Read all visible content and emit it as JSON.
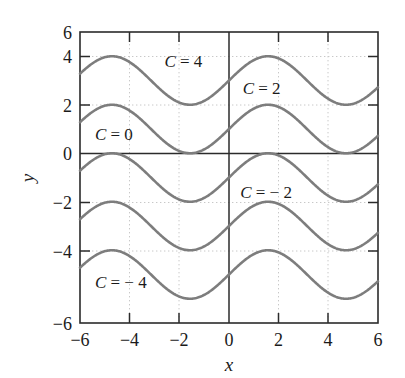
{
  "chart_data": {
    "type": "line",
    "title": "",
    "xlabel": "x",
    "ylabel": "y",
    "xlim": [
      -6,
      6
    ],
    "ylim": [
      -6,
      6
    ],
    "xticks": [
      -6,
      -4,
      -2,
      0,
      2,
      4,
      6
    ],
    "yticks": [
      -6,
      -4,
      -2,
      0,
      2,
      4,
      6
    ],
    "xtick_labels": [
      "−6",
      "−4",
      "−2",
      "0",
      "2",
      "4",
      "6"
    ],
    "ytick_labels": [
      "−6",
      "−4",
      "−2",
      "0",
      "2",
      "4",
      "6"
    ],
    "grid": true,
    "grid_style": "dotted",
    "legend": "none",
    "series": [
      {
        "name": "k = 4",
        "formula": "y = sin(x) + 4",
        "offset": 4,
        "amplitude": 1,
        "period": 6.2832,
        "phase": 0
      },
      {
        "name": "k = 2",
        "formula": "y = sin(x) + 2",
        "offset": 2,
        "amplitude": 1,
        "period": 6.2832,
        "phase": 0
      },
      {
        "name": "k = 0",
        "formula": "y = sin(x)",
        "offset": 0,
        "amplitude": 1,
        "period": 6.2832,
        "phase": 0
      },
      {
        "name": "k = -2",
        "formula": "y = sin(x) - 2",
        "offset": -2,
        "amplitude": 1,
        "period": 6.2832,
        "phase": 0
      },
      {
        "name": "k = -4",
        "formula": "y = sin(x) - 4",
        "offset": -4,
        "amplitude": 1,
        "period": 6.2832,
        "phase": 0
      }
    ],
    "annotations": [
      {
        "text": "C = 4",
        "c_value": 4,
        "x": -2.6,
        "y": 4.55
      },
      {
        "text": "C = 2",
        "c_value": 2,
        "x": 0.55,
        "y": 3.45
      },
      {
        "text": "C = 0",
        "c_value": 0,
        "x": -5.4,
        "y": 1.55
      },
      {
        "text": "C = − 2",
        "c_value": -2,
        "x": 0.45,
        "y": -0.85
      },
      {
        "text": "C = − 4",
        "c_value": -4,
        "x": -5.4,
        "y": -4.55
      }
    ]
  },
  "style": {
    "curve_color": "#7d7d7d",
    "axis_color": "#2b2b2b",
    "grid_color": "#c8c8c8",
    "text_color": "#1a1a1a",
    "background": "#ffffff"
  }
}
